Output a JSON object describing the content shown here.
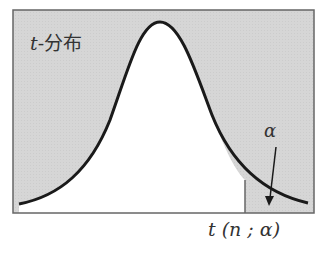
{
  "diagram": {
    "title_var": "t",
    "title_text": "-分布",
    "alpha_label": "α",
    "critical_label": "t (n ; α)",
    "colors": {
      "shade": "#d4d4d4",
      "frame": "#666666",
      "curve": "#1a1a1a",
      "background": "#ffffff"
    }
  }
}
